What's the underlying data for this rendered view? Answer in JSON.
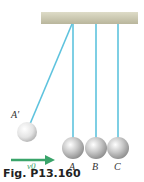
{
  "figure": {
    "caption": "Fig. P13.160",
    "labels": {
      "a_prime": "A′",
      "a": "A",
      "b": "B",
      "c": "C",
      "velocity": "v0"
    },
    "colors": {
      "support": "#cbc8b0",
      "string": "#5ec3de",
      "ball": "#c9c9c9",
      "arrow": "#3aa46a"
    }
  }
}
